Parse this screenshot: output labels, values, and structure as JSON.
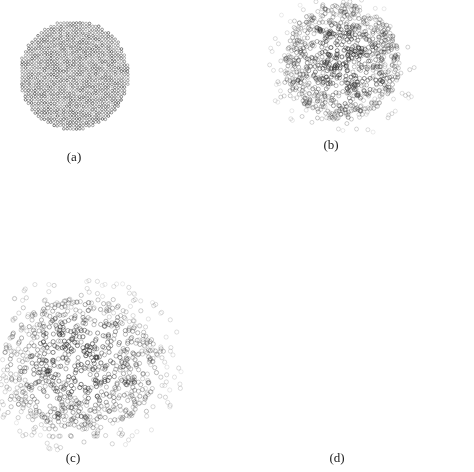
{
  "figure": {
    "width": 474,
    "height": 472,
    "background": "#ffffff",
    "marker": "open-circle",
    "marker_color": "#2a2a2a",
    "panels": [
      {
        "id": "a",
        "label": "(a)",
        "label_pos": [
          74,
          158
        ],
        "kind": "lattice-disk",
        "center": [
          74,
          75
        ],
        "radius": 55,
        "spacing": 3.2,
        "marker_radius": 1.3,
        "count_hint": 1000,
        "seed": 11
      },
      {
        "id": "b",
        "label": "(b)",
        "label_pos": [
          331,
          146
        ],
        "kind": "random-cloud",
        "center": [
          342,
          62
        ],
        "radius": [
          58,
          58
        ],
        "count": 1000,
        "marker_radius": 2.0,
        "halo": 0.08,
        "seed": 22
      },
      {
        "id": "c",
        "label": "(c)",
        "label_pos": [
          73,
          459
        ],
        "kind": "random-cloud",
        "center": [
          80,
          365
        ],
        "radius": [
          78,
          66
        ],
        "count": 1000,
        "marker_radius": 2.1,
        "halo": 0.2,
        "seed": 33
      },
      {
        "id": "d",
        "label": "(d)",
        "label_pos": [
          337,
          459
        ],
        "kind": "gaussian-cloud",
        "center": [
          325,
          335
        ],
        "sigma": [
          62,
          52
        ],
        "count": 1000,
        "marker_radius": 2.1,
        "seed": 44
      }
    ]
  }
}
